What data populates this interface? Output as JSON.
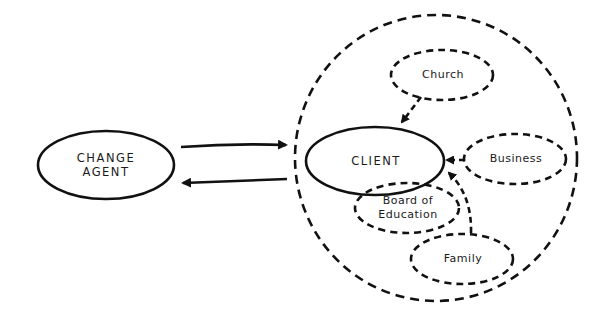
{
  "nodes": {
    "change_agent": {
      "line1": "CHANGE",
      "line2": "AGENT",
      "border": "solid"
    },
    "client_system": {
      "label": "",
      "border": "dashed"
    },
    "client": {
      "label": "CLIENT",
      "border": "solid"
    },
    "church": {
      "label": "Church",
      "border": "dashed"
    },
    "business": {
      "label": "Business",
      "border": "dashed"
    },
    "board_of_education": {
      "line1": "Board of",
      "line2": "Education",
      "border": "dashed"
    },
    "family": {
      "label": "Family",
      "border": "dashed"
    }
  },
  "edges": [
    {
      "from": "change_agent",
      "to": "client_system",
      "style": "solid"
    },
    {
      "from": "client_system",
      "to": "change_agent",
      "style": "solid"
    },
    {
      "from": "church",
      "to": "client",
      "style": "dashed"
    },
    {
      "from": "business",
      "to": "client",
      "style": "dashed"
    },
    {
      "from": "family",
      "to": "client",
      "style": "dashed"
    }
  ],
  "colors": {
    "stroke": "#111111",
    "background": "#ffffff"
  }
}
